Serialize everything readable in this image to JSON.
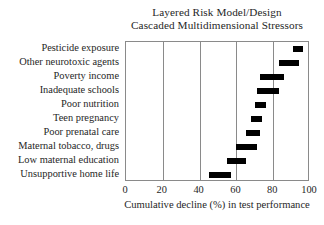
{
  "chart_data": {
    "type": "bar",
    "title": "Layered Risk Model/Design\nCascaded Multidimensional Stressors",
    "title_lines": [
      "Layered Risk Model/Design",
      "Cascaded Multidimensional Stressors"
    ],
    "xlabel": "Cumulative decline (%) in test performance",
    "ylabel": "",
    "xlim": [
      0,
      100
    ],
    "ylim": [
      0,
      10
    ],
    "grid": true,
    "gridlines_vertical_at": [
      0,
      20,
      40,
      60,
      80,
      100
    ],
    "legend": null,
    "legend_position": "none",
    "orientation": "horizontal",
    "bar_style": "floating-range-bar",
    "xticks": [
      0,
      20,
      40,
      60,
      80,
      100
    ],
    "xtick_labels": [
      "0",
      "20",
      "40",
      "60",
      "80",
      "100"
    ],
    "categories": [
      "Pesticide exposure",
      "Other neurotoxic agents",
      "Poverty income",
      "Inadequate schools",
      "Poor nutrition",
      "Teen pregnancy",
      "Poor prenatal care",
      "Maternal tobacco, drugs",
      "Low maternal education",
      "Unsupportive home life"
    ],
    "bars": [
      {
        "category": "Pesticide exposure",
        "start": 91,
        "end": 96,
        "width": 5
      },
      {
        "category": "Other neurotoxic agents",
        "start": 83,
        "end": 94,
        "width": 11
      },
      {
        "category": "Poverty income",
        "start": 73,
        "end": 86,
        "width": 13
      },
      {
        "category": "Inadequate schools",
        "start": 71,
        "end": 83,
        "width": 12
      },
      {
        "category": "Poor nutrition",
        "start": 70,
        "end": 76,
        "width": 6
      },
      {
        "category": "Teen pregnancy",
        "start": 68,
        "end": 74,
        "width": 6
      },
      {
        "category": "Poor prenatal care",
        "start": 65,
        "end": 73,
        "width": 8
      },
      {
        "category": "Maternal tobacco, drugs",
        "start": 60,
        "end": 71,
        "width": 11
      },
      {
        "category": "Low maternal education",
        "start": 55,
        "end": 65,
        "width": 10
      },
      {
        "category": "Unsupportive home life",
        "start": 45,
        "end": 57,
        "width": 12
      }
    ],
    "values": [
      96,
      94,
      86,
      83,
      76,
      74,
      73,
      71,
      65,
      57
    ],
    "colors": {
      "bar": "#000000",
      "axis": "#8a8a8a",
      "text": "#262626",
      "background": "#ffffff"
    }
  }
}
